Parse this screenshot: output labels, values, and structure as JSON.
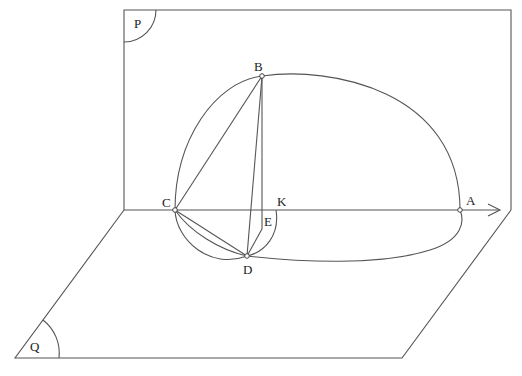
{
  "figure": {
    "type": "solid geometry diagram"
  },
  "planes": {
    "P": {
      "label": "P"
    },
    "Q": {
      "label": "Q"
    }
  },
  "points": {
    "A": {
      "label": "A"
    },
    "B": {
      "label": "B"
    },
    "C": {
      "label": "C"
    },
    "D": {
      "label": "D"
    },
    "E": {
      "label": "E"
    },
    "K": {
      "label": "K"
    }
  },
  "segments": [
    "CB",
    "BD",
    "BE",
    "CD",
    "DE",
    "CA"
  ],
  "arcs": [
    "semicircle CBA in plane P",
    "semi-ellipse CDA in plane Q",
    "arc CD (lower)",
    "arc CDK",
    "arc DE to K"
  ],
  "colors": {
    "line": "#555555",
    "background": "#ffffff"
  }
}
